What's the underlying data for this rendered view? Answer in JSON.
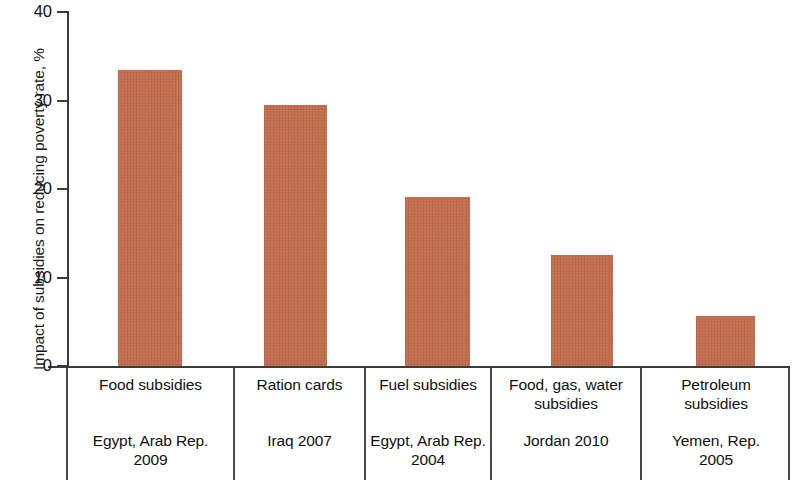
{
  "chart_data": {
    "type": "bar",
    "title": "",
    "xlabel": "",
    "ylabel": "Impact of subsidies on reducing poverty rate, %",
    "ylim": [
      0,
      40
    ],
    "yticks": [
      "0",
      "10",
      "20",
      "30",
      "40"
    ],
    "ytick_values": [
      0,
      10,
      20,
      30,
      40
    ],
    "grid": false,
    "legend": null,
    "bar_color": "#c06a4a",
    "axis_color": "#3a3a3a",
    "categories": [
      "Food subsidies",
      "Ration cards",
      "Fuel subsidies",
      "Food, gas, water subsidies",
      "Petroleum subsidies"
    ],
    "values": [
      33.4,
      29.5,
      19.1,
      12.5,
      5.6
    ],
    "series": [
      {
        "name": "Impact of subsidies on reducing poverty rate",
        "values": [
          33.4,
          29.5,
          19.1,
          12.5,
          5.6
        ]
      }
    ],
    "bars": [
      {
        "program": "Food subsidies",
        "country_year": "Egypt, Arab Rep. 2009",
        "country": "Egypt, Arab Rep.",
        "year": "2009",
        "value": 33.4
      },
      {
        "program": "Ration cards",
        "country_year": "Iraq 2007",
        "country": "Iraq",
        "year": "2007",
        "value": 29.5
      },
      {
        "program": "Fuel subsidies",
        "country_year": "Egypt, Arab Rep. 2004",
        "country": "Egypt, Arab Rep.",
        "year": "2004",
        "value": 19.1
      },
      {
        "program": "Food, gas, water subsidies",
        "country_year": "Jordan 2010",
        "country": "Jordan",
        "year": "2010",
        "value": 12.5
      },
      {
        "program": "Petroleum subsidies",
        "country_year": "Yemen, Rep. 2005",
        "country": "Yemen, Rep.",
        "year": "2005",
        "value": 5.6
      }
    ]
  },
  "axis": {
    "y_title": "Impact of subsidies on reducing poverty rate, %",
    "ticks": [
      {
        "label": "40"
      },
      {
        "label": "30"
      },
      {
        "label": "20"
      },
      {
        "label": "10"
      },
      {
        "label": "0"
      }
    ]
  },
  "columns": [
    {
      "program_line1": "Food subsidies",
      "program_line2": "",
      "country_line1": "Egypt, Arab Rep.",
      "country_line2": "2009"
    },
    {
      "program_line1": "Ration cards",
      "program_line2": "",
      "country_line1": "Iraq 2007",
      "country_line2": ""
    },
    {
      "program_line1": "Fuel subsidies",
      "program_line2": "",
      "country_line1": "Egypt, Arab Rep.",
      "country_line2": "2004"
    },
    {
      "program_line1": "Food, gas, water",
      "program_line2": "subsidies",
      "country_line1": "Jordan 2010",
      "country_line2": ""
    },
    {
      "program_line1": "Petroleum",
      "program_line2": "subsidies",
      "country_line1": "Yemen, Rep.",
      "country_line2": "2005"
    }
  ]
}
